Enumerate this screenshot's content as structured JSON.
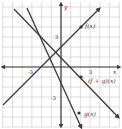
{
  "chart_data": {
    "type": "line",
    "title": "",
    "xlabel": "x",
    "ylabel": "y",
    "xlim": [
      -6,
      6
    ],
    "ylim": [
      -6,
      6
    ],
    "grid": true,
    "grid_step": 1,
    "tick_labels": {
      "x": [
        {
          "value": -3,
          "label": "-3"
        },
        {
          "value": 3,
          "label": "3"
        }
      ],
      "y": [
        {
          "value": 3,
          "label": "3"
        },
        {
          "value": -3,
          "label": "-3"
        }
      ]
    },
    "series": [
      {
        "name": "f(x)",
        "equation": "f(x) = x + 2",
        "slope": 1,
        "intercept": 2,
        "label": "f(x)",
        "marker_point": [
          2,
          4
        ]
      },
      {
        "name": "g(x)",
        "equation": "g(x) = -2x - 1",
        "slope": -2,
        "intercept": -1,
        "label": "g(x)",
        "marker_point": [
          1.8,
          -4.6
        ]
      },
      {
        "name": "(f + g)(x)",
        "equation": "(f + g)(x) = -x + 1",
        "slope": -1,
        "intercept": 1,
        "label": "(f + g)(x)",
        "marker_point": [
          2,
          -1
        ]
      }
    ],
    "legend": "inline labels"
  },
  "axes": {
    "x_label": "x",
    "y_label": "y",
    "x_tick_neg": "-3",
    "x_tick_pos": "3",
    "y_tick_pos": "3",
    "y_tick_neg": "-3"
  },
  "labels": {
    "f": "f(x)",
    "g": "g(x)",
    "fg": "(f + g)(x)"
  }
}
